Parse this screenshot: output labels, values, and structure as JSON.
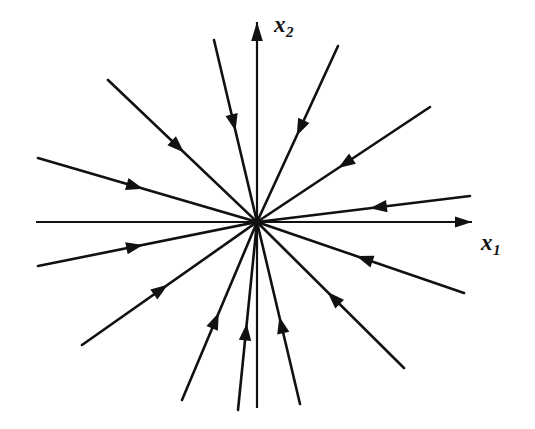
{
  "figure": {
    "kind": "phase-portrait",
    "caption": "",
    "background_color": "#ffffff",
    "stroke_color": "#111111",
    "width": 535,
    "height": 429
  },
  "axes": {
    "origin": {
      "x": 257,
      "y": 222
    },
    "x1": {
      "label": "x",
      "subscript": "1",
      "label_position": {
        "x": 481,
        "y": 231
      },
      "direction": "horizontal",
      "arrow_at": "positive-end",
      "start": {
        "x": 36,
        "y": 222
      },
      "end": {
        "x": 472,
        "y": 222
      }
    },
    "x2": {
      "label": "x",
      "subscript": "2",
      "label_position": {
        "x": 274,
        "y": 13
      },
      "direction": "vertical",
      "arrow_at": "positive-end",
      "start": {
        "x": 257,
        "y": 408
      },
      "end": {
        "x": 257,
        "y": 22
      }
    }
  },
  "chart_data": {
    "type": "line",
    "title": "",
    "xlabel": "x1",
    "ylabel": "x2",
    "equilibrium": {
      "x": 0,
      "y": 0,
      "classification": "stable node"
    },
    "flow_direction": "inward",
    "grid": false,
    "legend": null,
    "xlim": [
      -1,
      1
    ],
    "ylim": [
      -1,
      1
    ],
    "trajectories": [
      {
        "id": "ray-1",
        "angle_deg": 13,
        "outer": {
          "x": 470,
          "y": 196
        },
        "arrow_t": 0.53,
        "arrow": true
      },
      {
        "id": "ray-2",
        "angle_deg": 40,
        "outer": {
          "x": 430,
          "y": 107
        },
        "arrow_t": 0.47,
        "arrow": true
      },
      {
        "id": "ray-3",
        "angle_deg": 71,
        "outer": {
          "x": 338,
          "y": 46
        },
        "arrow_t": 0.49,
        "arrow": true
      },
      {
        "id": "ray-4",
        "angle_deg": 106,
        "outer": {
          "x": 214,
          "y": 40
        },
        "arrow_t": 0.5,
        "arrow": true
      },
      {
        "id": "ray-5",
        "angle_deg": 137,
        "outer": {
          "x": 108,
          "y": 80
        },
        "arrow_t": 0.49,
        "arrow": true
      },
      {
        "id": "ray-6",
        "angle_deg": 166,
        "outer": {
          "x": 38,
          "y": 158
        },
        "arrow_t": 0.52,
        "arrow": true
      },
      {
        "id": "ray-7",
        "angle_deg": 180,
        "outer": {
          "x": 36,
          "y": 222
        },
        "arrow_t": 0.0,
        "arrow": false
      },
      {
        "id": "ray-8",
        "angle_deg": 193,
        "outer": {
          "x": 38,
          "y": 266
        },
        "arrow_t": 0.52,
        "arrow": true
      },
      {
        "id": "ray-9",
        "angle_deg": 221,
        "outer": {
          "x": 82,
          "y": 345
        },
        "arrow_t": 0.51,
        "arrow": true
      },
      {
        "id": "ray-10",
        "angle_deg": 247,
        "outer": {
          "x": 182,
          "y": 400
        },
        "arrow_t": 0.51,
        "arrow": true
      },
      {
        "id": "ray-11",
        "angle_deg": 264,
        "outer": {
          "x": 238,
          "y": 410
        },
        "arrow_t": 0.54,
        "arrow": true
      },
      {
        "id": "ray-12",
        "angle_deg": 284,
        "outer": {
          "x": 300,
          "y": 404
        },
        "arrow_t": 0.52,
        "arrow": true
      },
      {
        "id": "ray-13",
        "angle_deg": 312,
        "outer": {
          "x": 404,
          "y": 368
        },
        "arrow_t": 0.48,
        "arrow": true
      },
      {
        "id": "ray-14",
        "angle_deg": 338,
        "outer": {
          "x": 464,
          "y": 293
        },
        "arrow_t": 0.48,
        "arrow": true
      },
      {
        "id": "ray-15",
        "angle_deg": 0,
        "outer": {
          "x": 472,
          "y": 222
        },
        "arrow_t": 0.0,
        "arrow": false
      },
      {
        "id": "ray-16",
        "angle_deg": 90,
        "outer": {
          "x": 257,
          "y": 22
        },
        "arrow_t": 0.0,
        "arrow": false
      }
    ]
  }
}
